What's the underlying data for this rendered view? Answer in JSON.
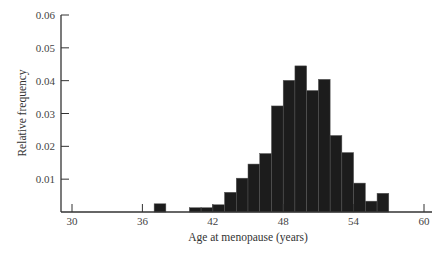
{
  "chart_data": {
    "type": "bar",
    "title": "",
    "xlabel": "Age at menopause (years)",
    "ylabel": "Relative frequency",
    "xlim": [
      29,
      61
    ],
    "ylim": [
      0,
      0.06
    ],
    "xticks": [
      30,
      36,
      42,
      48,
      54,
      60
    ],
    "yticks": [
      0.01,
      0.02,
      0.03,
      0.04,
      0.05,
      0.06
    ],
    "ytick_labels": [
      "0.01",
      "0.02",
      "0.03",
      "0.04",
      "0.05",
      "0.06"
    ],
    "grid": false,
    "legend": null,
    "bin_width": 1,
    "bins": [
      {
        "start": 37,
        "end": 38,
        "value": 0.0025
      },
      {
        "start": 40,
        "end": 41,
        "value": 0.0013
      },
      {
        "start": 41,
        "end": 42,
        "value": 0.0013
      },
      {
        "start": 42,
        "end": 43,
        "value": 0.0022
      },
      {
        "start": 43,
        "end": 44,
        "value": 0.006
      },
      {
        "start": 44,
        "end": 45,
        "value": 0.0103
      },
      {
        "start": 45,
        "end": 46,
        "value": 0.0146
      },
      {
        "start": 46,
        "end": 47,
        "value": 0.0178
      },
      {
        "start": 47,
        "end": 48,
        "value": 0.0323
      },
      {
        "start": 48,
        "end": 49,
        "value": 0.0401
      },
      {
        "start": 49,
        "end": 50,
        "value": 0.0445
      },
      {
        "start": 50,
        "end": 51,
        "value": 0.037
      },
      {
        "start": 51,
        "end": 52,
        "value": 0.0404
      },
      {
        "start": 52,
        "end": 53,
        "value": 0.0233
      },
      {
        "start": 53,
        "end": 54,
        "value": 0.0181
      },
      {
        "start": 54,
        "end": 55,
        "value": 0.0088
      },
      {
        "start": 55,
        "end": 56,
        "value": 0.0033
      },
      {
        "start": 56,
        "end": 57,
        "value": 0.0057
      }
    ],
    "colors": {
      "bar": "#1c1c1c",
      "axis": "#333333"
    }
  }
}
